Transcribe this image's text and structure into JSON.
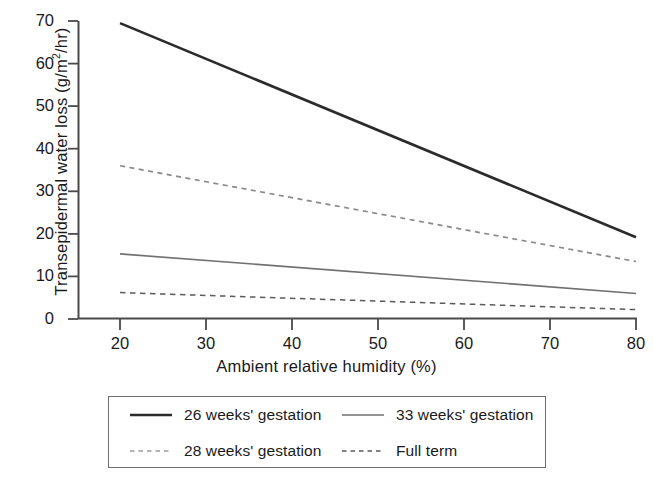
{
  "chart_data": {
    "type": "line",
    "title": "",
    "xlabel": "Ambient relative humidity (%)",
    "ylabel_text": "Transepidermal water loss (g/m",
    "ylabel_sup": "2",
    "ylabel_tail": "/hr)",
    "ylabel_full": "Transepidermal water loss (g/m2/hr)",
    "x": [
      20,
      80
    ],
    "xlim": [
      15,
      80
    ],
    "ylim": [
      0,
      70
    ],
    "xticks": [
      20,
      30,
      40,
      50,
      60,
      70,
      80
    ],
    "xtick_labels": [
      "20",
      "30",
      "40",
      "50",
      "60",
      "70",
      "80"
    ],
    "yticks": [
      0,
      10,
      20,
      30,
      40,
      50,
      60,
      70
    ],
    "ytick_labels": [
      "0",
      "10",
      "20",
      "30",
      "40",
      "50",
      "60",
      "70"
    ],
    "grid": false,
    "legend_position": "below-center",
    "series": [
      {
        "name": "26 weeks' gestation",
        "style": "solid",
        "color": "#2b2b2b",
        "width": 2.6,
        "x": [
          20,
          80
        ],
        "values": [
          69.5,
          19.2
        ]
      },
      {
        "name": "28 weeks' gestation",
        "style": "dotted",
        "color": "#8a8a8a",
        "width": 1.7,
        "x": [
          20,
          80
        ],
        "values": [
          36.0,
          13.5
        ]
      },
      {
        "name": "33 weeks' gestation",
        "style": "solid",
        "color": "#707070",
        "width": 1.6,
        "x": [
          20,
          80
        ],
        "values": [
          15.3,
          6.0
        ]
      },
      {
        "name": "Full term",
        "style": "dashed",
        "color": "#5a5a5a",
        "width": 1.5,
        "x": [
          20,
          80
        ],
        "values": [
          6.2,
          2.2
        ]
      }
    ]
  },
  "legend": {
    "entries": [
      {
        "label": "26 weeks' gestation",
        "swatch": "solid-thick-dark"
      },
      {
        "label": "33 weeks' gestation",
        "swatch": "solid-thin-gray"
      },
      {
        "label": "28 weeks' gestation",
        "swatch": "dotted-light"
      },
      {
        "label": "Full term",
        "swatch": "dashed-gray"
      }
    ]
  },
  "axes": {
    "frame_color": "#4a4a4a",
    "tick_color": "#4a4a4a"
  }
}
